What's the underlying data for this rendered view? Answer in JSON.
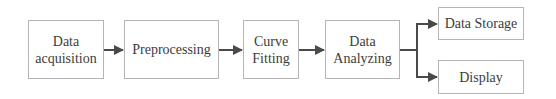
{
  "diagram": {
    "type": "flowchart",
    "direction": "left-to-right",
    "colors": {
      "border": "#b5b5b5",
      "arrow": "#4a4a4a",
      "text": "#3c3c3c",
      "background": "#ffffff"
    },
    "nodes": [
      {
        "id": "data-acquisition",
        "label": "Data\nacquisition"
      },
      {
        "id": "preprocessing",
        "label": "Preprocessing"
      },
      {
        "id": "curve-fitting",
        "label": "Curve\nFitting"
      },
      {
        "id": "data-analyzing",
        "label": "Data\nAnalyzing"
      },
      {
        "id": "data-storage",
        "label": "Data Storage"
      },
      {
        "id": "display",
        "label": "Display"
      }
    ],
    "edges": [
      {
        "from": "data-acquisition",
        "to": "preprocessing"
      },
      {
        "from": "preprocessing",
        "to": "curve-fitting"
      },
      {
        "from": "curve-fitting",
        "to": "data-analyzing"
      },
      {
        "from": "data-analyzing",
        "to": "data-storage"
      },
      {
        "from": "data-analyzing",
        "to": "display"
      }
    ]
  }
}
